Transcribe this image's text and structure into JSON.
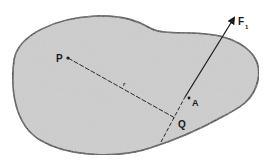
{
  "diagram": {
    "labels": {
      "force": "F",
      "force_subscript": "1",
      "point_p": "P",
      "point_q": "Q",
      "point_a": "A",
      "vector_r": "r"
    },
    "colors": {
      "body_fill": "#d4d4d4",
      "outline": "#1a1a1a",
      "background": "#ffffff"
    }
  }
}
